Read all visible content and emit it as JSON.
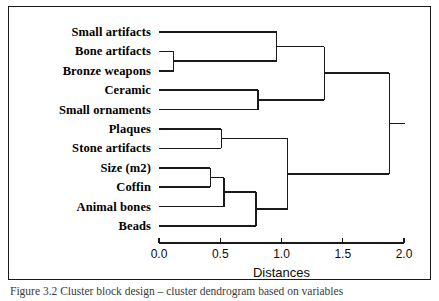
{
  "figure": {
    "caption": "Figure 3.2   Cluster block design – cluster dendrogram based on variables"
  },
  "chart_data": {
    "type": "dendrogram",
    "title": "",
    "xlabel": "Distances",
    "ylabel": "",
    "xlim": [
      0.0,
      2.0
    ],
    "grid": false,
    "legend": null,
    "orientation": "horizontal",
    "tick_labels": [
      "0.0",
      "0.5",
      "1.0",
      "1.5",
      "2.0"
    ],
    "tick_values": [
      0.0,
      0.5,
      1.0,
      1.5,
      2.0
    ],
    "leaves": [
      "Small artifacts",
      "Bone artifacts",
      "Bronze weapons",
      "Ceramic",
      "Small ornaments",
      "Plaques",
      "Stone artifacts",
      "Size (m2)",
      "Coffin",
      "Animal bones",
      "Beads"
    ],
    "merges": [
      {
        "id": "m1",
        "left": "Bone artifacts",
        "right": "Bronze weapons",
        "distance": 0.12
      },
      {
        "id": "m2",
        "left": "Small artifacts",
        "right": "m1",
        "distance": 0.96
      },
      {
        "id": "m3",
        "left": "Ceramic",
        "right": "Small ornaments",
        "distance": 0.81
      },
      {
        "id": "m4",
        "left": "m2",
        "right": "m3",
        "distance": 1.35
      },
      {
        "id": "m5",
        "left": "Plaques",
        "right": "Stone artifacts",
        "distance": 0.51
      },
      {
        "id": "m6",
        "left": "Size (m2)",
        "right": "Coffin",
        "distance": 0.42
      },
      {
        "id": "m7",
        "left": "m6",
        "right": "Animal bones",
        "distance": 0.53
      },
      {
        "id": "m8",
        "left": "m7",
        "right": "Beads",
        "distance": 0.79
      },
      {
        "id": "m9",
        "left": "m5",
        "right": "m8",
        "distance": 1.05
      },
      {
        "id": "m10",
        "left": "m4",
        "right": "m9",
        "distance": 1.88
      }
    ]
  }
}
